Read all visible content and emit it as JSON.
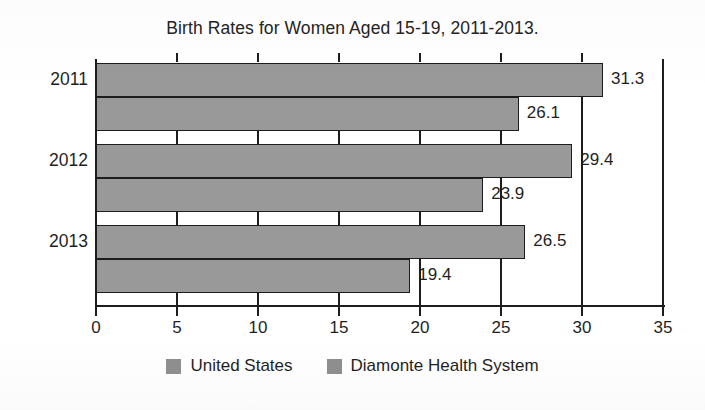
{
  "chart_data": {
    "type": "bar",
    "orientation": "horizontal",
    "title": "Birth Rates for Women Aged 15-19, 2011-2013.",
    "xlabel": "",
    "ylabel": "",
    "xlim": [
      0,
      35
    ],
    "categories": [
      "2011",
      "2012",
      "2013"
    ],
    "xticks": [
      "0",
      "5",
      "10",
      "15",
      "20",
      "25",
      "30",
      "35"
    ],
    "xtick_values": [
      0,
      5,
      10,
      15,
      20,
      25,
      30,
      35
    ],
    "grid": true,
    "legend_position": "bottom",
    "series": [
      {
        "name": "United States",
        "color": "#999999",
        "values": [
          31.3,
          29.4,
          26.5
        ],
        "labels": [
          "31.3",
          "29.4",
          "26.5"
        ]
      },
      {
        "name": "Diamonte Health System",
        "color": "#999999",
        "values": [
          26.1,
          23.9,
          19.4
        ],
        "labels": [
          "26.1",
          "23.9",
          "19.4"
        ]
      }
    ],
    "bars": [
      {
        "category": "2011",
        "series": "United States",
        "value": 31.3,
        "label": "31.3"
      },
      {
        "category": "2011",
        "series": "Diamonte Health System",
        "value": 26.1,
        "label": "26.1"
      },
      {
        "category": "2012",
        "series": "United States",
        "value": 29.4,
        "label": "29.4"
      },
      {
        "category": "2012",
        "series": "Diamonte Health System",
        "value": 23.9,
        "label": "23.9"
      },
      {
        "category": "2013",
        "series": "United States",
        "value": 26.5,
        "label": "26.5"
      },
      {
        "category": "2013",
        "series": "Diamonte Health System",
        "value": 19.4,
        "label": "19.4"
      }
    ]
  },
  "legend": {
    "items": [
      {
        "label": "United States",
        "swatch": "#8f8f8f"
      },
      {
        "label": "Diamonte Health System",
        "swatch": "#8f8f8f"
      }
    ]
  }
}
